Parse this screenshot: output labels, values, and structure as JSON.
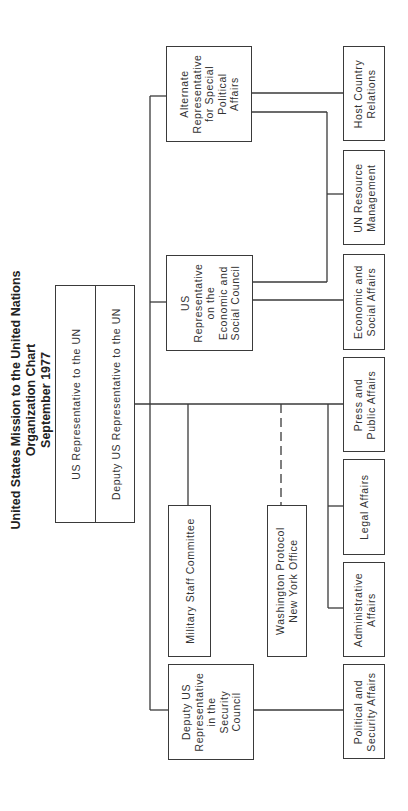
{
  "title": {
    "line1": "United States Mission to the United Nations",
    "line2": "Organization Chart",
    "line3": "September 1977"
  },
  "main_box": {
    "top_label": "US Representative to the UN",
    "bottom_label": "Deputy US Representative to the UN"
  },
  "representatives": {
    "alternate_special_political": "Alternate\nRepresentative\nfor Special\nPolitical\nAffairs",
    "ecosoc": "US\nRepresentative\non the\nEconomic and\nSocial Council",
    "security_council": "Deputy US\nRepresentative\nin the\nSecurity\nCouncil"
  },
  "staff_units": {
    "military_staff": "Military Staff Committee",
    "washington_protocol": "Washington Protocol\nNew York Office"
  },
  "offices": {
    "host_country": "Host Country\nRelations",
    "un_resource": "UN Resource\nManagement",
    "economic_social": "Economic and\nSocial Affairs",
    "press_public": "Press and\nPublic Affairs",
    "legal": "Legal Affairs",
    "administrative": "Administrative\nAffairs",
    "political_security": "Political and\nSecurity Affairs"
  },
  "colors": {
    "line": "#3a3a3a",
    "background": "#ffffff"
  }
}
